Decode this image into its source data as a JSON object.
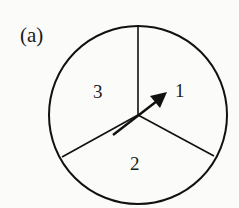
{
  "figure": {
    "label": "(a)",
    "type": "spinner",
    "sectors": [
      {
        "id": 1,
        "label": "1"
      },
      {
        "id": 2,
        "label": "2"
      },
      {
        "id": 3,
        "label": "3"
      }
    ],
    "pointer": {
      "points_to": "1"
    }
  }
}
